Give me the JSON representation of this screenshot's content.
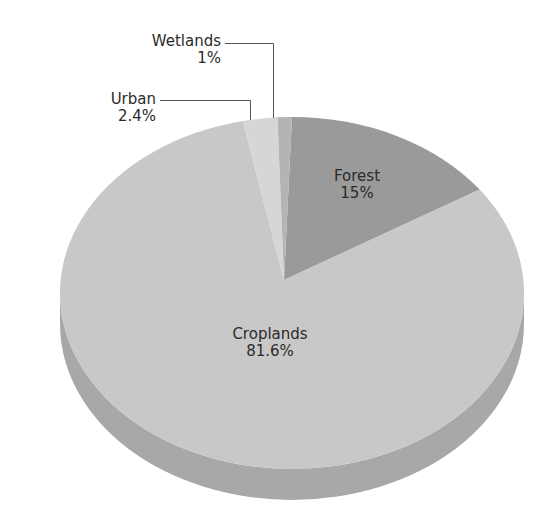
{
  "chart_data": {
    "type": "pie",
    "title": "",
    "style": "3d",
    "slices": [
      {
        "label": "Forest",
        "value": 15,
        "display": "15%",
        "color": "#9a9a9a"
      },
      {
        "label": "Croplands",
        "value": 81.6,
        "display": "81.6%",
        "color": "#c8c8c8"
      },
      {
        "label": "Urban",
        "value": 2.4,
        "display": "2.4%",
        "color": "#d6d6d6"
      },
      {
        "label": "Wetlands",
        "value": 1,
        "display": "1%",
        "color": "#b4b4b4"
      }
    ],
    "depth_color": "#a8a8a8",
    "leader_line_color": "#555555"
  },
  "labels": {
    "forest": {
      "name": "Forest",
      "pct": "15%"
    },
    "croplands": {
      "name": "Croplands",
      "pct": "81.6%"
    },
    "urban": {
      "name": "Urban",
      "pct": "2.4%"
    },
    "wetlands": {
      "name": "Wetlands",
      "pct": "1%"
    }
  }
}
